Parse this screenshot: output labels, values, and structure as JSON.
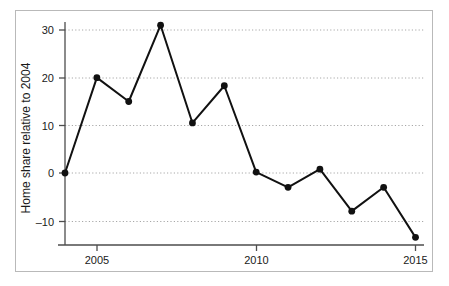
{
  "chart_data": {
    "type": "line",
    "title": "",
    "xlabel": "",
    "ylabel": "Home share relative to 2004",
    "x": [
      2004,
      2005,
      2006,
      2007,
      2008,
      2009,
      2010,
      2011,
      2012,
      2013,
      2014,
      2015
    ],
    "values": [
      0,
      20,
      15,
      31,
      10.5,
      18.3,
      0.2,
      -3,
      0.8,
      -8,
      -3,
      -13.5
    ],
    "series": [
      {
        "name": "Home share relative to 2004",
        "values": [
          0,
          20,
          15,
          31,
          10.5,
          18.3,
          0.2,
          -3,
          0.8,
          -8,
          -3,
          -13.5
        ]
      }
    ],
    "xlim": [
      2003.7,
      2015.3
    ],
    "ylim": [
      -15.5,
      33
    ],
    "xticks": [
      2005,
      2010,
      2015
    ],
    "xtick_labels": [
      "2005",
      "2010",
      "2015"
    ],
    "yticks": [
      -10,
      0,
      10,
      20,
      30
    ],
    "ytick_labels": [
      "–10",
      "0",
      "10",
      "20",
      "30"
    ],
    "grid": "horizontal-dotted",
    "legend": "none",
    "marker": "circle-filled",
    "line_color": "#111111",
    "marker_color": "#111111",
    "grid_color": "#a8a8a8",
    "axis_color": "#4d4d4d",
    "frame_color": "#b9b9b9",
    "background": "#ffffff"
  },
  "axes": {
    "y_axis_title": "Home share relative to 2004",
    "y_tick_labels": [
      "30",
      "20",
      "10",
      "0",
      "–10"
    ],
    "x_tick_labels": [
      "2005",
      "2010",
      "2015"
    ]
  }
}
